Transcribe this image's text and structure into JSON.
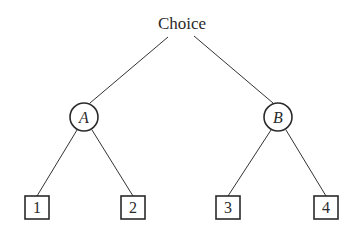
{
  "diagram": {
    "type": "decision-tree",
    "root": {
      "label": "Choice"
    },
    "nodes": [
      {
        "id": "A",
        "label": "A",
        "shape": "circle",
        "children": [
          "1",
          "2"
        ]
      },
      {
        "id": "B",
        "label": "B",
        "shape": "circle",
        "children": [
          "3",
          "4"
        ]
      }
    ],
    "leaves": [
      {
        "id": "1",
        "label": "1",
        "shape": "square"
      },
      {
        "id": "2",
        "label": "2",
        "shape": "square"
      },
      {
        "id": "3",
        "label": "3",
        "shape": "square"
      },
      {
        "id": "4",
        "label": "4",
        "shape": "square"
      }
    ],
    "edges": [
      {
        "from": "Choice",
        "to": "A"
      },
      {
        "from": "Choice",
        "to": "B"
      },
      {
        "from": "A",
        "to": "1"
      },
      {
        "from": "A",
        "to": "2"
      },
      {
        "from": "B",
        "to": "3"
      },
      {
        "from": "B",
        "to": "4"
      }
    ]
  }
}
